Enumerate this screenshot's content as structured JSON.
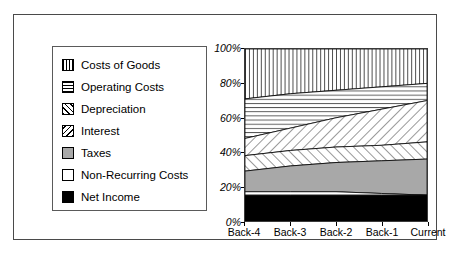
{
  "chart_data": {
    "type": "area",
    "title": "",
    "subtitle": "",
    "xlabel": "",
    "ylabel": "",
    "stacked": true,
    "percent_stacked": true,
    "grid": false,
    "legend_position": "left",
    "categories": [
      "Back-4",
      "Back-3",
      "Back-2",
      "Back-1",
      "Current"
    ],
    "ylim": [
      0,
      100
    ],
    "yticks": [
      0,
      20,
      40,
      60,
      80,
      100
    ],
    "ytick_labels": [
      "0%",
      "20%",
      "40%",
      "60%",
      "80%",
      "100%"
    ],
    "series": [
      {
        "name": "Costs of Goods",
        "pattern": "vertical-lines",
        "fill": "#ffffff",
        "values": [
          29,
          26,
          24,
          22,
          20
        ],
        "cumulative_top": [
          100,
          100,
          100,
          100,
          100
        ]
      },
      {
        "name": "Operating Costs",
        "pattern": "horizontal-lines",
        "fill": "#ffffff",
        "values": [
          23,
          20,
          16,
          13,
          10
        ],
        "cumulative_top": [
          71,
          74,
          76,
          78,
          80
        ]
      },
      {
        "name": "Depreciation",
        "pattern": "forward-diagonal",
        "fill": "#ffffff",
        "values": [
          10,
          13,
          17,
          21,
          24
        ],
        "cumulative_top": [
          48,
          54,
          60,
          65,
          70
        ]
      },
      {
        "name": "Interest",
        "pattern": "backward-diagonal",
        "fill": "#ffffff",
        "values": [
          9,
          9,
          9,
          9,
          10
        ],
        "cumulative_top": [
          38,
          41,
          43,
          44,
          46
        ]
      },
      {
        "name": "Taxes",
        "pattern": "solid",
        "fill": "#a8a8a8",
        "values": [
          12,
          15,
          17,
          19,
          21
        ],
        "cumulative_top": [
          29,
          32,
          34,
          35,
          36
        ]
      },
      {
        "name": "Non-Recurring Costs",
        "pattern": "solid",
        "fill": "#ffffff",
        "values": [
          2,
          2,
          1,
          1,
          0
        ],
        "cumulative_top": [
          17,
          17,
          17,
          16,
          15
        ]
      },
      {
        "name": "Net Income",
        "pattern": "solid",
        "fill": "#000000",
        "values": [
          15,
          15,
          15,
          15,
          15
        ],
        "cumulative_top": [
          15,
          15,
          15,
          15,
          15
        ]
      }
    ]
  },
  "legend": {
    "items": [
      {
        "label": "Costs of Goods",
        "swatch": "swatch-vertical-lines"
      },
      {
        "label": "Operating Costs",
        "swatch": "swatch-horizontal-lines"
      },
      {
        "label": "Depreciation",
        "swatch": "swatch-forward-diagonal"
      },
      {
        "label": "Interest",
        "swatch": "swatch-backward-diagonal"
      },
      {
        "label": "Taxes",
        "swatch": "swatch-gray-fill"
      },
      {
        "label": "Non-Recurring Costs",
        "swatch": "swatch-white-fill"
      },
      {
        "label": "Net Income",
        "swatch": "swatch-black-fill"
      }
    ]
  },
  "colors": {
    "taxes_gray": "#a8a8a8",
    "net_income_black": "#000000",
    "frame_border": "#4a4a4a",
    "plot_border": "#3a3a3a",
    "background": "#ffffff"
  }
}
